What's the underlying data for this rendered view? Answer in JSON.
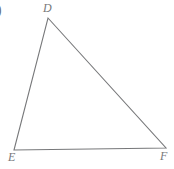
{
  "figure": {
    "kind": "triangle",
    "name": "triangle-DEF",
    "canvas": {
      "width": 174,
      "height": 169,
      "background": "#ffffff"
    },
    "stroke": {
      "color": "#77787a",
      "width": 1.1
    },
    "vertices": [
      {
        "id": "D",
        "label": "D",
        "x": 48,
        "y": 18,
        "label_x": 43,
        "label_y": 2
      },
      {
        "id": "E",
        "label": "E",
        "x": 14,
        "y": 150,
        "label_x": 8,
        "label_y": 151
      },
      {
        "id": "F",
        "label": "F",
        "x": 166,
        "y": 148,
        "label_x": 160,
        "label_y": 150
      }
    ],
    "edges": [
      {
        "id": "DE",
        "from": "D",
        "to": "E"
      },
      {
        "id": "DF",
        "from": "D",
        "to": "F"
      },
      {
        "id": "EF",
        "from": "E",
        "to": "F"
      }
    ],
    "polygon_points": "48,18 166,148 14,150"
  },
  "annotations": {
    "choice_marker": ")"
  }
}
